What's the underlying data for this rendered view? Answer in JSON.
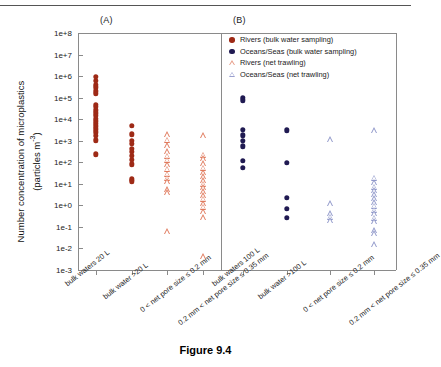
{
  "figure": {
    "caption": "Figure 9.4",
    "panel_a_label": "(A)",
    "panel_b_label": "(B)"
  },
  "legend": {
    "position": "top-right-of-panel-B",
    "items": [
      {
        "label": "Rivers (bulk water sampling)",
        "marker": "filled-circle",
        "color": "#9e2a16"
      },
      {
        "label": "Oceans/Seas (bulk water sampling)",
        "marker": "filled-circle",
        "color": "#201a52"
      },
      {
        "label": "Rivers (net trawling)",
        "marker": "open-triangle",
        "color": "#e8a08c"
      },
      {
        "label": "Oceans/Seas (net trawling)",
        "marker": "open-triangle",
        "color": "#9aa0cf"
      }
    ]
  },
  "colors": {
    "rivers_bulk": "#9e2a16",
    "oceans_bulk": "#201a52",
    "rivers_net": "#e07a5c",
    "oceans_net": "#8f97c9",
    "axis": "#8a8a8a",
    "text": "#1a1a1a"
  },
  "chart_data": {
    "type": "scatter",
    "title": "",
    "ylabel": "Number concentration of microplastics (particles m-3)",
    "ylabel_main": "Number concentration of microplastics",
    "ylabel_units": "(particles m",
    "ylabel_exponent": "-3",
    "ylabel_units_close": ")",
    "yscale": "log",
    "ylim": [
      0.001,
      100000000
    ],
    "ytick_labels": [
      "1e+8",
      "1e+7",
      "1e+6",
      "1e+5",
      "1e+4",
      "1e+3",
      "1e+2",
      "1e+1",
      "1e+0",
      "1e-1",
      "1e-2",
      "1e-3"
    ],
    "ytick_values": [
      100000000,
      10000000,
      1000000,
      100000,
      10000,
      1000,
      100,
      10,
      1,
      0.1,
      0.01,
      0.001
    ],
    "grid": false,
    "panels": [
      {
        "name": "A",
        "label": "(A)",
        "categories": [
          "bulk waters  20 L",
          "bulk water >20 L",
          "0 < net pore size ≤  0.2 mm",
          "0.2 mm < net pore size ≤  0.35 mm"
        ],
        "series": [
          {
            "name": "Rivers (bulk water sampling)",
            "marker": "filled-circle",
            "color": "#9e2a16",
            "points": [
              {
                "x": 1,
                "y": 900000
              },
              {
                "x": 1,
                "y": 620000
              },
              {
                "x": 1,
                "y": 400000
              },
              {
                "x": 1,
                "y": 300000
              },
              {
                "x": 1,
                "y": 200000
              },
              {
                "x": 1,
                "y": 150000
              },
              {
                "x": 1,
                "y": 48000
              },
              {
                "x": 1,
                "y": 37000
              },
              {
                "x": 1,
                "y": 26000
              },
              {
                "x": 1,
                "y": 19000
              },
              {
                "x": 1,
                "y": 14000
              },
              {
                "x": 1,
                "y": 10500
              },
              {
                "x": 1,
                "y": 8000
              },
              {
                "x": 1,
                "y": 6200
              },
              {
                "x": 1,
                "y": 4600
              },
              {
                "x": 1,
                "y": 3400
              },
              {
                "x": 1,
                "y": 2500
              },
              {
                "x": 1,
                "y": 1700
              },
              {
                "x": 1,
                "y": 1050
              },
              {
                "x": 1,
                "y": 230
              },
              {
                "x": 2,
                "y": 5000
              },
              {
                "x": 2,
                "y": 2000
              },
              {
                "x": 2,
                "y": 1000
              },
              {
                "x": 2,
                "y": 700
              },
              {
                "x": 2,
                "y": 430
              },
              {
                "x": 2,
                "y": 300
              },
              {
                "x": 2,
                "y": 200
              },
              {
                "x": 2,
                "y": 130
              },
              {
                "x": 2,
                "y": 80
              },
              {
                "x": 2,
                "y": 16
              },
              {
                "x": 2,
                "y": 13
              }
            ]
          },
          {
            "name": "Rivers (net trawling)",
            "marker": "open-triangle",
            "color": "#e07a5c",
            "points": [
              {
                "x": 3,
                "y": 2000
              },
              {
                "x": 3,
                "y": 1100
              },
              {
                "x": 3,
                "y": 620
              },
              {
                "x": 3,
                "y": 330
              },
              {
                "x": 3,
                "y": 200
              },
              {
                "x": 3,
                "y": 130
              },
              {
                "x": 3,
                "y": 80
              },
              {
                "x": 3,
                "y": 50
              },
              {
                "x": 3,
                "y": 30
              },
              {
                "x": 3,
                "y": 19
              },
              {
                "x": 3,
                "y": 13
              },
              {
                "x": 3,
                "y": 5.5
              },
              {
                "x": 3,
                "y": 4.0
              },
              {
                "x": 3,
                "y": 0.065
              },
              {
                "x": 4,
                "y": 1800
              },
              {
                "x": 4,
                "y": 220
              },
              {
                "x": 4,
                "y": 150
              },
              {
                "x": 4,
                "y": 90
              },
              {
                "x": 4,
                "y": 55
              },
              {
                "x": 4,
                "y": 35
              },
              {
                "x": 4,
                "y": 22
              },
              {
                "x": 4,
                "y": 15
              },
              {
                "x": 4,
                "y": 10
              },
              {
                "x": 4,
                "y": 7
              },
              {
                "x": 4,
                "y": 4.5
              },
              {
                "x": 4,
                "y": 3.0
              },
              {
                "x": 4,
                "y": 2.0
              },
              {
                "x": 4,
                "y": 1.3
              },
              {
                "x": 4,
                "y": 0.85
              },
              {
                "x": 4,
                "y": 0.55
              },
              {
                "x": 4,
                "y": 0.28
              },
              {
                "x": 4,
                "y": 0.0045
              }
            ]
          }
        ]
      },
      {
        "name": "B",
        "label": "(B)",
        "categories": [
          "bulk waters  100 L",
          "bulk water >100 L",
          "0 < net pore size ≤  0.2 mm",
          "0.2 mm < net pore size ≤  0.35 mm"
        ],
        "series": [
          {
            "name": "Oceans/Seas (bulk water sampling)",
            "marker": "filled-circle",
            "color": "#201a52",
            "points": [
              {
                "x": 1,
                "y": 100000
              },
              {
                "x": 1,
                "y": 75000
              },
              {
                "x": 1,
                "y": 3200
              },
              {
                "x": 1,
                "y": 1800
              },
              {
                "x": 1,
                "y": 1000
              },
              {
                "x": 1,
                "y": 560
              },
              {
                "x": 1,
                "y": 120
              },
              {
                "x": 1,
                "y": 55
              },
              {
                "x": 2,
                "y": 3000
              },
              {
                "x": 2,
                "y": 95
              },
              {
                "x": 2,
                "y": 2.2
              },
              {
                "x": 2,
                "y": 0.7
              },
              {
                "x": 2,
                "y": 0.27
              }
            ]
          },
          {
            "name": "Oceans/Seas (net trawling)",
            "marker": "open-triangle",
            "color": "#8f97c9",
            "points": [
              {
                "x": 3,
                "y": 1200
              },
              {
                "x": 3,
                "y": 1.3
              },
              {
                "x": 3,
                "y": 0.42
              },
              {
                "x": 3,
                "y": 0.3
              },
              {
                "x": 3,
                "y": 0.2
              },
              {
                "x": 4,
                "y": 3000
              },
              {
                "x": 4,
                "y": 19
              },
              {
                "x": 4,
                "y": 12
              },
              {
                "x": 4,
                "y": 7.5
              },
              {
                "x": 4,
                "y": 5.0
              },
              {
                "x": 4,
                "y": 3.2
              },
              {
                "x": 4,
                "y": 2.1
              },
              {
                "x": 4,
                "y": 1.4
              },
              {
                "x": 4,
                "y": 0.95
              },
              {
                "x": 4,
                "y": 0.62
              },
              {
                "x": 4,
                "y": 0.42
              },
              {
                "x": 4,
                "y": 0.27
              },
              {
                "x": 4,
                "y": 0.18
              },
              {
                "x": 4,
                "y": 0.07
              },
              {
                "x": 4,
                "y": 0.05
              },
              {
                "x": 4,
                "y": 0.016
              }
            ]
          }
        ]
      }
    ]
  }
}
